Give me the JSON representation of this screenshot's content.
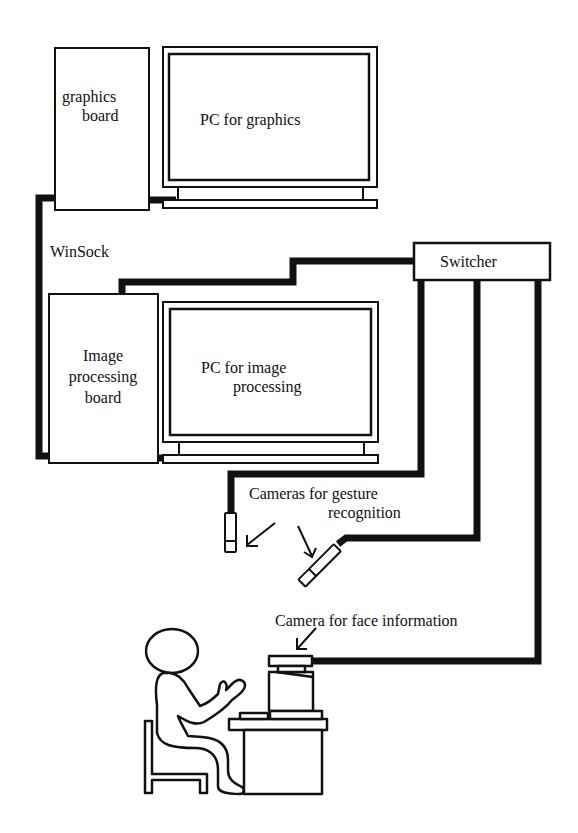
{
  "diagram": {
    "type": "system-architecture",
    "colors": {
      "line": "#111111",
      "background": "#ffffff"
    },
    "nodes": {
      "graphics_board": {
        "label_line1": "graphics",
        "label_line2": "board"
      },
      "pc_graphics": {
        "label": "PC for graphics"
      },
      "image_board": {
        "label_line1": "Image",
        "label_line2": "processing",
        "label_line3": "board"
      },
      "pc_image": {
        "label_line1": "PC for image",
        "label_line2": "processing"
      },
      "switcher": {
        "label": "Switcher"
      },
      "gesture_cameras": {
        "label_line1": "Cameras for gesture",
        "label_line2": "recognition"
      },
      "face_camera": {
        "label": "Camera for face information"
      }
    },
    "connections": {
      "winsock": {
        "label": "WinSock"
      }
    }
  }
}
